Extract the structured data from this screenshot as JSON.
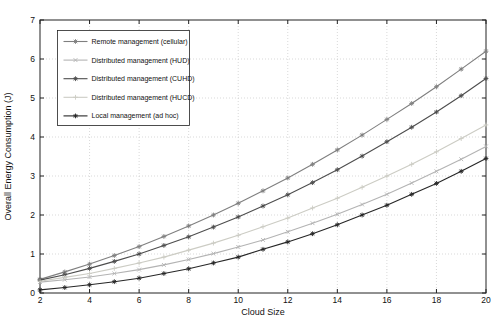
{
  "figure": {
    "background": "#ffffff",
    "axis_color": "#222222",
    "grid_color": "#c8c8c8",
    "text_color": "#111111"
  },
  "chart_data": {
    "type": "line",
    "title": "",
    "xlabel": "Cloud Size",
    "ylabel": "Overall Energy Consumption (J)",
    "xlim": [
      2,
      20
    ],
    "ylim": [
      0,
      7
    ],
    "x_ticks": [
      2,
      4,
      6,
      8,
      10,
      12,
      14,
      16,
      18,
      20
    ],
    "y_ticks": [
      0,
      1,
      2,
      3,
      4,
      5,
      6,
      7
    ],
    "grid": true,
    "legend_position": "upper-left-inside",
    "x": [
      2,
      3,
      4,
      5,
      6,
      7,
      8,
      9,
      10,
      11,
      12,
      13,
      14,
      15,
      16,
      17,
      18,
      19,
      20
    ],
    "series": [
      {
        "name": "Remote management (cellular)",
        "color": "#7f7f7f",
        "marker": "asterisk",
        "values": [
          0.35,
          0.54,
          0.74,
          0.96,
          1.19,
          1.45,
          1.72,
          2.0,
          2.3,
          2.62,
          2.95,
          3.3,
          3.67,
          4.05,
          4.45,
          4.86,
          5.29,
          5.74,
          6.2
        ]
      },
      {
        "name": "Distributed management (HUD)",
        "color": "#b3b3b3",
        "marker": "x",
        "values": [
          0.28,
          0.34,
          0.41,
          0.5,
          0.6,
          0.72,
          0.86,
          1.01,
          1.18,
          1.36,
          1.57,
          1.79,
          2.02,
          2.27,
          2.53,
          2.82,
          3.12,
          3.43,
          3.76
        ]
      },
      {
        "name": "Distributed management (CUHD)",
        "color": "#4d4d4d",
        "marker": "asterisk",
        "values": [
          0.33,
          0.47,
          0.63,
          0.81,
          1.0,
          1.22,
          1.44,
          1.69,
          1.95,
          2.23,
          2.52,
          2.83,
          3.16,
          3.51,
          3.88,
          4.25,
          4.64,
          5.06,
          5.5
        ]
      },
      {
        "name": "Distributed management (HUCD)",
        "color": "#ccccc4",
        "marker": "plus",
        "values": [
          0.3,
          0.4,
          0.5,
          0.63,
          0.77,
          0.92,
          1.1,
          1.28,
          1.48,
          1.7,
          1.92,
          2.18,
          2.43,
          2.71,
          3.0,
          3.3,
          3.62,
          3.96,
          4.31
        ]
      },
      {
        "name": "Local management (ad hoc)",
        "color": "#262626",
        "marker": "asterisk",
        "values": [
          0.08,
          0.14,
          0.21,
          0.29,
          0.38,
          0.5,
          0.62,
          0.77,
          0.92,
          1.12,
          1.31,
          1.52,
          1.75,
          2.0,
          2.25,
          2.53,
          2.81,
          3.12,
          3.45
        ]
      }
    ]
  }
}
